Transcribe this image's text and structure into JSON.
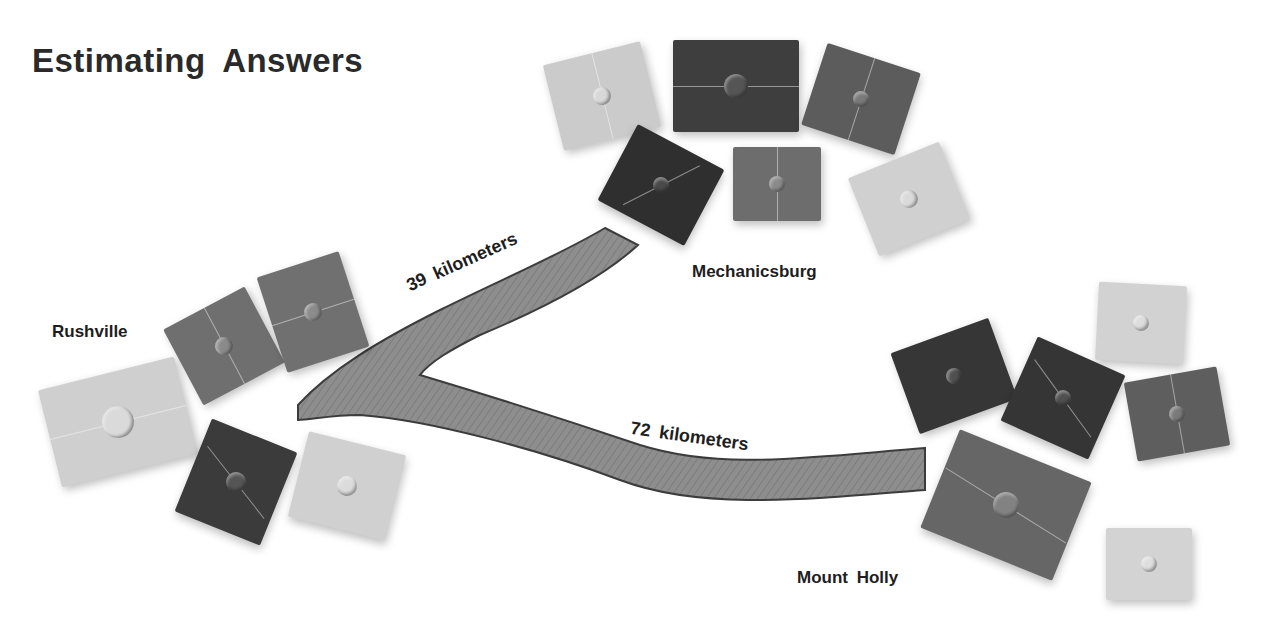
{
  "title": "Estimating Answers",
  "cities": {
    "rushville": "Rushville",
    "mechanicsburg": "Mechanicsburg",
    "mount_holly": "Mount Holly"
  },
  "routes": [
    {
      "from": "Rushville",
      "to": "Mechanicsburg",
      "label": "39 kilometers",
      "distance_km": 39
    },
    {
      "from": "Rushville",
      "to": "Mount Holly",
      "label": "72 kilometers",
      "distance_km": 72
    }
  ],
  "colors": {
    "light_tile": "#c9c9c9",
    "mid_tile": "#6e6e6e",
    "dark_tile": "#3a3a3a",
    "road": "#8d8d8d",
    "road_edge": "#3c3c3c"
  }
}
